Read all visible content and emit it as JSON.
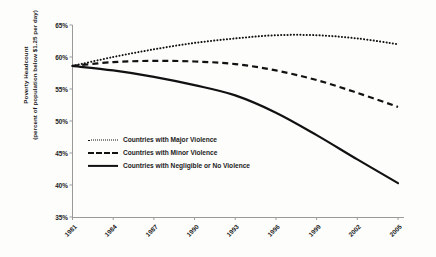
{
  "chart_data": {
    "type": "line",
    "title": "",
    "xlabel": "",
    "ylabel": "Poverty Headcount (percent of population below $1.25 per day)",
    "ylabel_lines": [
      "Poverty Headcount",
      "(percent of population below $1.25 per day)"
    ],
    "x": [
      1981,
      1984,
      1987,
      1990,
      1993,
      1996,
      1999,
      2002,
      2005
    ],
    "categories": [
      "1981",
      "1984",
      "1987",
      "1990",
      "1993",
      "1996",
      "1999",
      "2002",
      "2005"
    ],
    "xlim": [
      1981,
      2005
    ],
    "ylim": [
      35,
      65
    ],
    "yticks": [
      35,
      40,
      45,
      50,
      55,
      60,
      65
    ],
    "ytick_labels": [
      "35%",
      "40%",
      "45%",
      "50%",
      "55%",
      "60%",
      "65%"
    ],
    "grid": false,
    "legend_position": "center-left",
    "series": [
      {
        "name": "Countries with Major Violence",
        "style": "dotted",
        "color": "#111111",
        "values": [
          58.6,
          60.0,
          61.2,
          62.2,
          62.9,
          63.4,
          63.4,
          62.9,
          62.0
        ]
      },
      {
        "name": "Countries with Minor Violence",
        "style": "dashed",
        "color": "#111111",
        "values": [
          58.6,
          59.2,
          59.4,
          59.3,
          58.9,
          57.9,
          56.4,
          54.4,
          52.2
        ]
      },
      {
        "name": "Countries with Negligible or No Violence",
        "style": "solid",
        "color": "#111111",
        "values": [
          58.6,
          57.9,
          56.9,
          55.6,
          54.0,
          51.3,
          47.8,
          44.0,
          40.3
        ]
      }
    ]
  },
  "legend": {
    "items": [
      {
        "label": "Countries with Major Violence",
        "style": "dotted"
      },
      {
        "label": "Countries with Minor Violence",
        "style": "dashed"
      },
      {
        "label": "Countries with Negligible or No Violence",
        "style": "solid"
      }
    ]
  },
  "axes": {
    "y_title_line1": "Poverty Headcount",
    "y_title_line2": "(percent of population below $1.25 per day)"
  }
}
